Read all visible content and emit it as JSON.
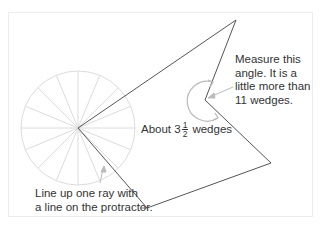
{
  "figure": {
    "annotations": {
      "measure_angle": [
        "Measure this",
        "angle. It is a",
        "little more than",
        "11 wedges."
      ],
      "line_up": [
        "Line up one ray with",
        "a line on the protractor."
      ],
      "about": {
        "prefix": "About 3",
        "fraction_numerator": "1",
        "fraction_denominator": "2",
        "suffix": "wedges"
      }
    },
    "protractor": {
      "wedges": 16,
      "center": [
        78,
        128
      ],
      "radius": 57
    },
    "shape": {
      "vertices": [
        [
          78,
          128
        ],
        [
          236,
          20
        ],
        [
          205,
          100
        ],
        [
          271,
          163
        ],
        [
          147,
          208
        ]
      ]
    },
    "colors": {
      "shape_stroke": "#555555",
      "protractor_stroke": "#dcdcdc",
      "arrow_stroke": "#bbbbbb",
      "text": "#333333"
    }
  }
}
